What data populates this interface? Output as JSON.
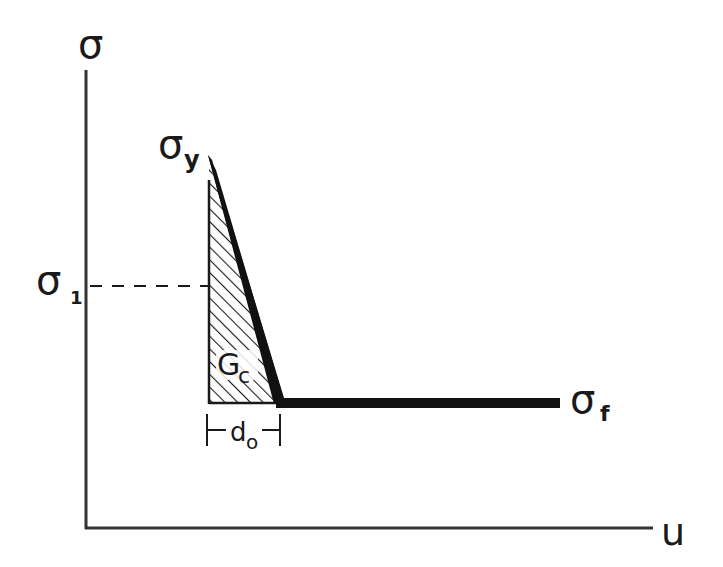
{
  "diagram": {
    "type": "stress-displacement-law",
    "axes": {
      "y_label": "σ",
      "x_label": "u"
    },
    "labels": {
      "peak_stress": {
        "symbol": "σ",
        "subscript": "y"
      },
      "intermediate_stress": {
        "symbol": "σ",
        "subscript": "1"
      },
      "final_stress": {
        "symbol": "σ",
        "subscript": "f"
      },
      "fracture_energy": {
        "symbol": "G",
        "subscript": "c"
      },
      "critical_displacement": {
        "symbol": "d",
        "subscript": "o"
      }
    },
    "colors": {
      "ink": "#1a1a1a",
      "background": "#ffffff"
    }
  }
}
